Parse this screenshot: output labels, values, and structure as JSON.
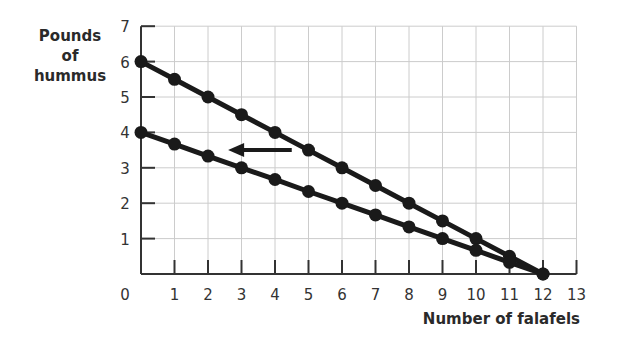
{
  "chart_data": {
    "type": "line",
    "title": "",
    "xlabel": "Number of falafels",
    "ylabel": "Pounds of hummus",
    "xlim": [
      0,
      13
    ],
    "ylim": [
      0,
      7
    ],
    "x_ticks": [
      0,
      1,
      2,
      3,
      4,
      5,
      6,
      7,
      8,
      9,
      10,
      11,
      12,
      13
    ],
    "y_ticks": [
      1,
      2,
      3,
      4,
      5,
      6,
      7
    ],
    "grid": true,
    "legend": null,
    "annotations": [
      {
        "type": "arrow",
        "direction": "left",
        "from": [
          4.5,
          3.5
        ],
        "to": [
          2.6,
          3.5
        ]
      }
    ],
    "series": [
      {
        "name": "Original PPF",
        "x": [
          0,
          1,
          2,
          3,
          4,
          5,
          6,
          7,
          8,
          9,
          10,
          11,
          12
        ],
        "values": [
          6,
          5.5,
          5,
          4.5,
          4,
          3.5,
          3,
          2.5,
          2,
          1.5,
          1,
          0.5,
          0
        ]
      },
      {
        "name": "New PPF",
        "x": [
          0,
          1,
          2,
          3,
          4,
          5,
          6,
          7,
          8,
          9,
          10,
          11,
          12
        ],
        "values": [
          4,
          3.67,
          3.33,
          3,
          2.67,
          2.33,
          2,
          1.67,
          1.33,
          1,
          0.67,
          0.33,
          0
        ]
      }
    ]
  },
  "labels": {
    "ylabel": "Pounds of hummus",
    "ylabel_lines": [
      "Pounds",
      "of",
      "hummus"
    ],
    "xlabel": "Number of falafels"
  }
}
